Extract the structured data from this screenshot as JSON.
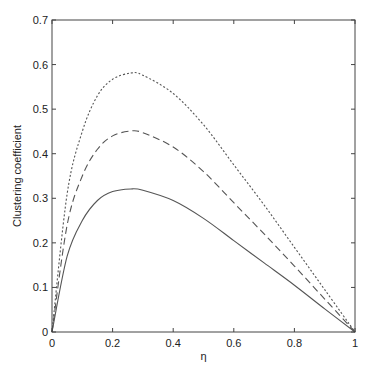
{
  "chart_data": {
    "type": "line",
    "title": "",
    "xlabel": "η",
    "ylabel": "Clustering coefficient",
    "xlim": [
      0,
      1
    ],
    "ylim": [
      0,
      0.7
    ],
    "xticks": [
      "0",
      "0.2",
      "0.4",
      "0.6",
      "0.8",
      "1"
    ],
    "yticks": [
      "0",
      "0.1",
      "0.2",
      "0.3",
      "0.4",
      "0.5",
      "0.6",
      "0.7"
    ],
    "grid": false,
    "legend": null,
    "x": [
      0,
      0.05,
      0.1,
      0.15,
      0.2,
      0.26,
      0.3,
      0.4,
      0.5,
      0.6,
      0.7,
      0.8,
      0.9,
      1.0
    ],
    "series": [
      {
        "name": "solid",
        "style": "solid",
        "values": [
          0,
          0.17,
          0.25,
          0.295,
          0.315,
          0.321,
          0.318,
          0.295,
          0.255,
          0.205,
          0.155,
          0.105,
          0.052,
          0
        ]
      },
      {
        "name": "dashed",
        "style": "dashed",
        "values": [
          0,
          0.24,
          0.35,
          0.41,
          0.44,
          0.451,
          0.447,
          0.415,
          0.36,
          0.29,
          0.22,
          0.148,
          0.074,
          0
        ]
      },
      {
        "name": "dotted",
        "style": "dotted",
        "values": [
          0,
          0.31,
          0.45,
          0.53,
          0.567,
          0.581,
          0.576,
          0.535,
          0.465,
          0.375,
          0.285,
          0.19,
          0.095,
          0
        ]
      }
    ]
  }
}
